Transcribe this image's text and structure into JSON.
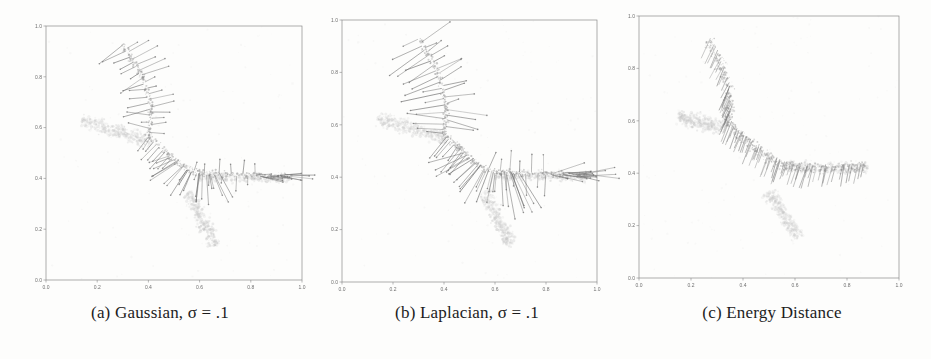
{
  "figure": {
    "background": "#fdfdfc"
  },
  "chart_data": [
    {
      "id": "gaussian",
      "type": "quiver-scatter",
      "caption": "(a) Gaussian, σ = .1",
      "xlim": [
        0,
        1
      ],
      "ylim": [
        0,
        1
      ],
      "xticks": [
        "0.0",
        "0.2",
        "0.4",
        "0.6",
        "0.8",
        "1.0"
      ],
      "yticks": [
        "0.0",
        "0.2",
        "0.4",
        "0.6",
        "0.8",
        "1.0"
      ],
      "grid": false,
      "colors": {
        "band": "#c2c2c2",
        "cloud": "#8f8f8f",
        "arrow": "#696969",
        "axis": "#8a8a8a",
        "tick": "#6f6f6f"
      },
      "seed": 7,
      "noise_dots": 120,
      "target_bands": [
        {
          "from": [
            0.14,
            0.625
          ],
          "to": [
            0.41,
            0.545
          ],
          "width": 0.04,
          "dots": 320
        },
        {
          "from": [
            0.555,
            0.345
          ],
          "to": [
            0.665,
            0.135
          ],
          "width": 0.04,
          "dots": 300
        },
        {
          "from": [
            0.6,
            0.405
          ],
          "to": [
            0.955,
            0.4
          ],
          "width": 0.026,
          "dots": 240
        }
      ],
      "particle_path": {
        "points": [
          [
            0.3,
            0.93
          ],
          [
            0.352,
            0.848
          ],
          [
            0.392,
            0.757
          ],
          [
            0.41,
            0.668
          ],
          [
            0.406,
            0.603
          ],
          [
            0.4,
            0.566
          ],
          [
            0.44,
            0.53
          ],
          [
            0.5,
            0.476
          ],
          [
            0.556,
            0.436
          ],
          [
            0.6,
            0.42
          ],
          [
            0.7,
            0.415
          ],
          [
            0.8,
            0.412
          ],
          [
            0.9,
            0.41
          ],
          [
            0.96,
            0.41
          ]
        ],
        "width": 0.02,
        "dots": 430
      },
      "fans": [
        {
          "type": "hedgehog",
          "trange": [
            0.0,
            0.38
          ],
          "count": 30,
          "len": [
            0.03,
            0.125
          ],
          "side": 0,
          "jitter": 18
        },
        {
          "type": "hedgehog",
          "trange": [
            0.38,
            0.52
          ],
          "count": 9,
          "len": [
            0.04,
            0.095
          ],
          "side": -1,
          "jitter": 12
        },
        {
          "type": "radial",
          "trange": [
            0.5,
            0.72
          ],
          "center": [
            0.615,
            0.53
          ],
          "count": 22,
          "len": [
            0.05,
            0.13
          ],
          "jitter": 8
        },
        {
          "type": "hedgehog",
          "trange": [
            0.58,
            0.86
          ],
          "count": 12,
          "len": [
            0.025,
            0.06
          ],
          "side": 0,
          "jitter": 10
        },
        {
          "type": "radial",
          "trange": [
            0.86,
            1.0
          ],
          "center": [
            0.8,
            0.412
          ],
          "count": 14,
          "len": [
            0.035,
            0.095
          ],
          "jitter": 20
        }
      ],
      "arrow": {
        "head": true,
        "len_scale": 1.0
      }
    },
    {
      "id": "laplacian",
      "type": "quiver-scatter",
      "caption": "(b) Laplacian, σ = .1",
      "xlim": [
        0,
        1
      ],
      "ylim": [
        0,
        1
      ],
      "xticks": [
        "0.0",
        "0.2",
        "0.4",
        "0.6",
        "0.8",
        "1.0"
      ],
      "yticks": [
        "0.0",
        "0.2",
        "0.4",
        "0.6",
        "0.8",
        "1.0"
      ],
      "grid": false,
      "colors": {
        "band": "#c2c2c2",
        "cloud": "#8f8f8f",
        "arrow": "#676767",
        "axis": "#8a8a8a",
        "tick": "#6f6f6f"
      },
      "seed": 11,
      "noise_dots": 120,
      "target_bands": [
        {
          "from": [
            0.14,
            0.625
          ],
          "to": [
            0.41,
            0.545
          ],
          "width": 0.04,
          "dots": 320
        },
        {
          "from": [
            0.555,
            0.345
          ],
          "to": [
            0.665,
            0.135
          ],
          "width": 0.04,
          "dots": 300
        },
        {
          "from": [
            0.6,
            0.405
          ],
          "to": [
            0.955,
            0.4
          ],
          "width": 0.026,
          "dots": 240
        }
      ],
      "particle_path": {
        "points": [
          [
            0.3,
            0.93
          ],
          [
            0.352,
            0.848
          ],
          [
            0.392,
            0.757
          ],
          [
            0.41,
            0.668
          ],
          [
            0.406,
            0.603
          ],
          [
            0.4,
            0.566
          ],
          [
            0.44,
            0.53
          ],
          [
            0.5,
            0.476
          ],
          [
            0.556,
            0.436
          ],
          [
            0.6,
            0.42
          ],
          [
            0.7,
            0.415
          ],
          [
            0.8,
            0.412
          ],
          [
            0.9,
            0.41
          ],
          [
            0.96,
            0.41
          ]
        ],
        "width": 0.02,
        "dots": 430
      },
      "fans": [
        {
          "type": "hedgehog",
          "trange": [
            0.0,
            0.38
          ],
          "count": 33,
          "len": [
            0.035,
            0.135
          ],
          "side": 0,
          "jitter": 18
        },
        {
          "type": "hedgehog",
          "trange": [
            0.38,
            0.52
          ],
          "count": 10,
          "len": [
            0.045,
            0.105
          ],
          "side": -1,
          "jitter": 12
        },
        {
          "type": "radial",
          "trange": [
            0.5,
            0.74
          ],
          "center": [
            0.615,
            0.535
          ],
          "count": 26,
          "len": [
            0.055,
            0.14
          ],
          "jitter": 8
        },
        {
          "type": "hedgehog",
          "trange": [
            0.58,
            0.86
          ],
          "count": 13,
          "len": [
            0.028,
            0.065
          ],
          "side": 0,
          "jitter": 10
        },
        {
          "type": "radial",
          "trange": [
            0.86,
            1.0
          ],
          "center": [
            0.795,
            0.412
          ],
          "count": 16,
          "len": [
            0.04,
            0.11
          ],
          "jitter": 22
        }
      ],
      "arrow": {
        "head": true,
        "len_scale": 1.25
      }
    },
    {
      "id": "energy-distance",
      "type": "quiver-scatter",
      "caption": "(c) Energy Distance",
      "xlim": [
        0,
        1
      ],
      "ylim": [
        0,
        1
      ],
      "xticks": [
        "0.0",
        "0.2",
        "0.4",
        "0.6",
        "0.8",
        "1.0"
      ],
      "yticks": [
        "0.0",
        "0.2",
        "0.4",
        "0.6",
        "0.8",
        "1.0"
      ],
      "grid": false,
      "colors": {
        "band": "#c4c4c4",
        "cloud": "#979797",
        "arrow": "#787878",
        "axis": "#8a8a8a",
        "tick": "#6f6f6f"
      },
      "seed": 5,
      "noise_dots": 130,
      "target_bands": [
        {
          "from": [
            0.15,
            0.615
          ],
          "to": [
            0.33,
            0.575
          ],
          "width": 0.042,
          "dots": 320
        },
        {
          "from": [
            0.5,
            0.33
          ],
          "to": [
            0.615,
            0.15
          ],
          "width": 0.04,
          "dots": 280
        },
        {
          "from": [
            0.56,
            0.425
          ],
          "to": [
            0.88,
            0.42
          ],
          "width": 0.03,
          "dots": 220
        }
      ],
      "particle_path": {
        "points": [
          [
            0.268,
            0.905
          ],
          [
            0.312,
            0.818
          ],
          [
            0.342,
            0.722
          ],
          [
            0.35,
            0.648
          ],
          [
            0.338,
            0.602
          ],
          [
            0.362,
            0.566
          ],
          [
            0.42,
            0.52
          ],
          [
            0.48,
            0.47
          ],
          [
            0.535,
            0.437
          ],
          [
            0.6,
            0.422
          ],
          [
            0.7,
            0.416
          ],
          [
            0.8,
            0.42
          ],
          [
            0.875,
            0.422
          ]
        ],
        "width": 0.032,
        "dots": 560
      },
      "fans": [
        {
          "type": "hatch",
          "trange": [
            0.0,
            1.0
          ],
          "count": 60,
          "len": [
            0.045,
            0.095
          ],
          "angle": [
            242,
            258
          ],
          "jitter": 7
        },
        {
          "type": "hatch",
          "trange": [
            0.22,
            0.78
          ],
          "count": 26,
          "len": [
            0.05,
            0.09
          ],
          "angle": [
            244,
            252
          ],
          "jitter": 6
        }
      ],
      "arrow": {
        "head": false,
        "len_scale": 1.0
      }
    }
  ]
}
